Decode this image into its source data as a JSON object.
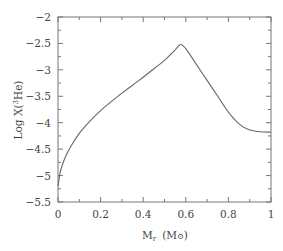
{
  "chart_data": {
    "type": "line",
    "title": "",
    "xlabel": "M_r (M☉)",
    "ylabel": "Log X(³He)",
    "xlim": [
      0,
      1
    ],
    "ylim": [
      -5.5,
      -2
    ],
    "grid": false,
    "legend": null,
    "x_ticks": [
      "0",
      "0.2",
      "0.4",
      "0.6",
      "0.8",
      "1"
    ],
    "y_ticks": [
      "-2",
      "-2.5",
      "-3",
      "-3.5",
      "-4",
      "-4.5",
      "-5",
      "-5.5"
    ],
    "series": [
      {
        "name": "Log X(3He)",
        "x": [
          0.0,
          0.01,
          0.02,
          0.04,
          0.06,
          0.1,
          0.15,
          0.2,
          0.25,
          0.3,
          0.35,
          0.4,
          0.45,
          0.5,
          0.55,
          0.575,
          0.6,
          0.65,
          0.7,
          0.75,
          0.8,
          0.85,
          0.9,
          0.95,
          1.0
        ],
        "y": [
          -5.2,
          -4.95,
          -4.8,
          -4.6,
          -4.45,
          -4.2,
          -3.97,
          -3.77,
          -3.6,
          -3.44,
          -3.29,
          -3.14,
          -2.98,
          -2.82,
          -2.62,
          -2.52,
          -2.6,
          -2.9,
          -3.2,
          -3.5,
          -3.8,
          -4.02,
          -4.14,
          -4.17,
          -4.18
        ]
      }
    ]
  },
  "labels": {
    "xlabel_main": "M",
    "xlabel_sub": "r",
    "xlabel_unit": "(M",
    "xlabel_sun": "⊙",
    "xlabel_close": ")",
    "ylabel_pre": "Log X(",
    "ylabel_sup": "3",
    "ylabel_post": "He)"
  }
}
